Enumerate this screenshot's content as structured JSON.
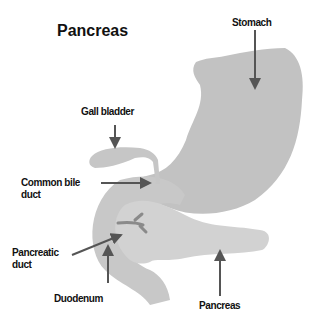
{
  "title": "Pancreas",
  "labels": {
    "stomach": "Stomach",
    "gall_bladder": "Gall bladder",
    "common_bile_duct_line1": "Common bile",
    "common_bile_duct_line2": "duct",
    "pancreatic_duct_line1": "Pancreatic",
    "pancreatic_duct_line2": "duct",
    "duodenum": "Duodenum",
    "pancreas": "Pancreas"
  },
  "colors": {
    "organ_fill": "#c4c4c4",
    "pancreas_fill": "#cfcfcf",
    "arrow": "#555555",
    "duct": "#8a8a8a",
    "text": "#111111"
  }
}
